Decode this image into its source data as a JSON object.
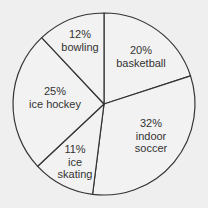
{
  "chart_data": {
    "type": "pie",
    "title": "",
    "start_angle_deg": 0,
    "direction": "clockwise",
    "categories": [
      "basketball",
      "indoor soccer",
      "ice skating",
      "ice hockey",
      "bowling"
    ],
    "values": [
      20,
      32,
      11,
      25,
      12
    ],
    "unit": "%",
    "slices": [
      {
        "label": "basketball",
        "percent_label": "20%",
        "lines": [
          "basketball"
        ],
        "value": 20,
        "label_pos": [
          141,
          56
        ]
      },
      {
        "label": "indoor soccer",
        "percent_label": "32%",
        "lines": [
          "indoor",
          "soccer"
        ],
        "value": 32,
        "label_pos": [
          151,
          136
        ]
      },
      {
        "label": "ice skating",
        "percent_label": "11%",
        "lines": [
          "ice",
          "skating"
        ],
        "value": 11,
        "label_pos": [
          75,
          162
        ]
      },
      {
        "label": "ice hockey",
        "percent_label": "25%",
        "lines": [
          "ice hockey"
        ],
        "value": 25,
        "label_pos": [
          55,
          97
        ]
      },
      {
        "label": "bowling",
        "percent_label": "12%",
        "lines": [
          "bowling"
        ],
        "value": 12,
        "label_pos": [
          80,
          40
        ]
      }
    ],
    "legend": null,
    "colors": {
      "background": "#efefef",
      "fill": "#f2f2f2",
      "stroke": "#333333",
      "text": "#333333"
    }
  }
}
